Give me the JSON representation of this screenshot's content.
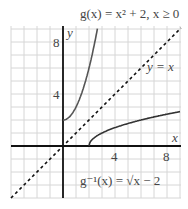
{
  "figure": {
    "title_g": "g(x) = x² + 2,  x ≥ 0",
    "label_identity": "y = x",
    "label_inverse": "g⁻¹(x) = √x − 2",
    "axis_x_label": "x",
    "axis_y_label": "y",
    "x_ticks": [
      "4",
      "8"
    ],
    "y_ticks": [
      "4",
      "8"
    ],
    "colors": {
      "grid": "#d6d6d6",
      "axis": "#111111",
      "curve": "#555555",
      "text": "#444444"
    }
  }
}
